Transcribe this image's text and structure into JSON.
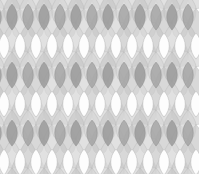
{
  "artwork": {
    "title": "Ogee Teardrop Lattice",
    "type": "geometric-pattern",
    "width": 199,
    "height": 174,
    "background": "#ffffff"
  },
  "geometry": {
    "column_pitch": 16.0,
    "row_pitch": 29.0,
    "columns": 11,
    "rows": 6,
    "origin_x": 12,
    "origin_y": -6,
    "teardrop_width": 16.0,
    "teardrop_height": 29.0,
    "lens_width": 14.0,
    "lens_height": 26.0
  },
  "palette": {
    "background": "#ffffff",
    "teardrop_light": "#c9c9c9",
    "teardrop_light_alt": "#d6d6d6",
    "lens_dark": "#9a9a9a",
    "lens_dark_alt": "#a5a5a5",
    "lens_white": "#fdfdfd",
    "outline": "#8c8c8c",
    "outline_soft": "#b4b4b4"
  },
  "rows": [
    {
      "index": 0,
      "lens_fill": "dark",
      "offset": 0,
      "label": "row-dark-1"
    },
    {
      "index": 1,
      "lens_fill": "white",
      "offset": 8,
      "label": "row-white-1"
    },
    {
      "index": 2,
      "lens_fill": "dark",
      "offset": 0,
      "label": "row-dark-2"
    },
    {
      "index": 3,
      "lens_fill": "white",
      "offset": 8,
      "label": "row-white-2"
    },
    {
      "index": 4,
      "lens_fill": "dark",
      "offset": 0,
      "label": "row-dark-3"
    },
    {
      "index": 5,
      "lens_fill": "white",
      "offset": 8,
      "label": "row-white-3"
    }
  ],
  "labels": {
    "canvas": "pattern-canvas",
    "layer_teardrops": "teardrop-layer",
    "layer_lenses": "lens-layer"
  }
}
